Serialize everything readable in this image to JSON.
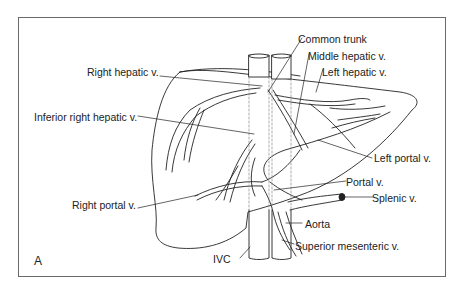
{
  "figure": {
    "panel_label": "A",
    "labels": {
      "common_trunk": "Common trunk",
      "middle_hepatic": "Middle hepatic v.",
      "left_hepatic": "Left hepatic v.",
      "right_hepatic": "Right hepatic v.",
      "inferior_right_hepatic": "Inferior right hepatic v.",
      "left_portal": "Left portal v.",
      "right_portal": "Right portal v.",
      "portal": "Portal v.",
      "splenic": "Splenic v.",
      "aorta": "Aorta",
      "superior_mesenteric": "Superior mesenteric v.",
      "ivc": "IVC"
    },
    "colors": {
      "line": "#222222",
      "frame": "#6a6a6a",
      "dashed": "#888888"
    }
  }
}
